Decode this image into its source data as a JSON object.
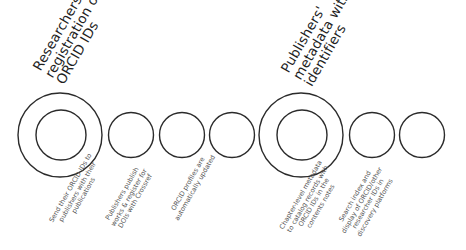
{
  "diagram": {
    "groups": [
      {
        "id": "researchers",
        "title_lines": [
          "Researchers'",
          "registration of",
          "ORCID IDs"
        ],
        "steps": [
          {
            "lines": [
              "Send their ORCID IDs to",
              "publishers with their",
              "publications"
            ]
          },
          {
            "lines": [
              "Publishers publish",
              "works & register for",
              "DOIs with Crossref"
            ]
          },
          {
            "lines": [
              "ORCID profiles are",
              "automatically updated"
            ]
          }
        ]
      },
      {
        "id": "publishers",
        "title_lines": [
          "Publishers'",
          "metadata with",
          "identifiers"
        ],
        "steps": [
          {
            "lines": [
              "Chapter-level metadata",
              "to catalog records with",
              "ORCID IDs in the",
              "contents notes"
            ]
          },
          {
            "lines": [
              "Search index and",
              "display of ORCID/other",
              "researcher IDs in",
              "discovery platforms"
            ]
          }
        ]
      }
    ],
    "colors": {
      "stroke": "#2b2b2b",
      "title_text": "#1f1f1f",
      "step_text": "#555555",
      "background": "#ffffff"
    }
  }
}
